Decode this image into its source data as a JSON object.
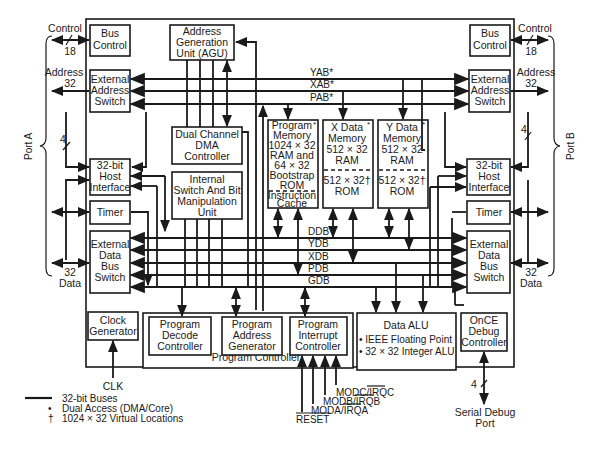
{
  "diagram": {
    "ports": {
      "left": {
        "name": "Port A",
        "control": "Control",
        "control_width": "18",
        "address": "Address",
        "address_width": "32",
        "host_width": "4",
        "data_width": "32",
        "data": "Data"
      },
      "right": {
        "name": "Port B",
        "control": "Control",
        "control_width": "18",
        "address": "Address",
        "address_width": "32",
        "host_width": "4",
        "data_width": "32",
        "data": "Data"
      }
    },
    "blocks": {
      "bus_control_left": [
        "Bus",
        "Control"
      ],
      "bus_control_right": [
        "Bus",
        "Control"
      ],
      "ext_addr_left": [
        "External",
        "Address",
        "Switch"
      ],
      "ext_addr_right": [
        "External",
        "Address",
        "Switch"
      ],
      "host_left": [
        "32-bit",
        "Host",
        "Interface"
      ],
      "host_right": [
        "32-bit",
        "Host",
        "Interface"
      ],
      "timer_left": [
        "Timer"
      ],
      "timer_right": [
        "Timer"
      ],
      "ext_data_left": [
        "External",
        "Data",
        "Bus",
        "Switch"
      ],
      "ext_data_right": [
        "External",
        "Data",
        "Bus",
        "Switch"
      ],
      "agu": [
        "Address",
        "Generation",
        "Unit (AGU)"
      ],
      "dma": [
        "Dual Channel",
        "DMA",
        "Controller"
      ],
      "switch_bit": [
        "Internal",
        "Switch And Bit",
        "Manipulation",
        "Unit"
      ],
      "program_memory": [
        "Program",
        "Memory",
        "1024 × 32",
        "RAM and",
        "64 × 32",
        "Bootstrap",
        "ROM"
      ],
      "instruction_cache": [
        "Instruction",
        "Cache"
      ],
      "x_memory_ram": [
        "X Data",
        "Memory",
        "512 × 32",
        "RAM"
      ],
      "x_memory_rom": [
        "512 × 32†",
        "ROM"
      ],
      "y_memory_ram": [
        "Y Data",
        "Memory",
        "512 × 32",
        "RAM"
      ],
      "y_memory_rom": [
        "512 × 32†",
        "ROM"
      ],
      "clock_gen": [
        "Clock",
        "Generator"
      ],
      "prog_decode": [
        "Program",
        "Decode",
        "Controller"
      ],
      "prog_addr_gen": [
        "Program",
        "Address",
        "Generator"
      ],
      "prog_interrupt": [
        "Program",
        "Interrupt",
        "Controller"
      ],
      "program_controller": "Program Controller",
      "data_alu_title": "Data ALU",
      "data_alu_items": [
        "• IEEE Floating Point",
        "• 32 × 32 Integer ALU"
      ],
      "once": [
        "OnCE",
        "Debug",
        "Controller"
      ]
    },
    "dual_access_mark": "*",
    "address_buses": [
      "YAB*",
      "XAB*",
      "PAB*"
    ],
    "data_buses": [
      "DDB",
      "YDB",
      "XDB",
      "PDB",
      "GDB"
    ],
    "signals": {
      "clk": "CLK",
      "modc": "MODC/IRQC",
      "modb": "MODB/IRQB",
      "moda": "MODA/IRQA",
      "reset": "RESET",
      "debug_width": "4",
      "serial_debug": [
        "Serial Debug",
        "Port"
      ]
    },
    "legend": [
      {
        "symbol": "line",
        "label": "32-bit Buses"
      },
      {
        "symbol": "•",
        "label": "Dual Access (DMA/Core)"
      },
      {
        "symbol": "†",
        "label": "1024 × 32 Virtual Locations"
      }
    ]
  }
}
